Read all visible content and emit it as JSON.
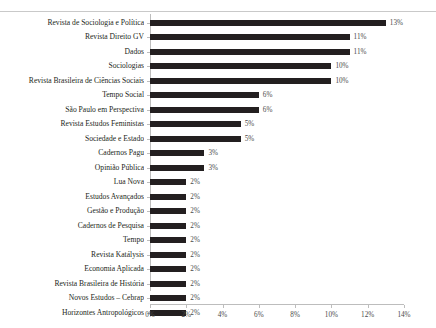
{
  "chart_data": {
    "type": "bar",
    "orientation": "horizontal",
    "title": "",
    "xlabel": "",
    "ylabel": "",
    "xlim": [
      0,
      14
    ],
    "grid": false,
    "legend": null,
    "bar_color": "#231f20",
    "axis_color": "#bdbdbd",
    "value_suffix": "%",
    "xticks": [
      "0%",
      "2%",
      "4%",
      "6%",
      "8%",
      "10%",
      "12%",
      "14%"
    ],
    "xtick_values": [
      0,
      2,
      4,
      6,
      8,
      10,
      12,
      14
    ],
    "categories": [
      "Revista de Sociologia e Política",
      "Revista Direito GV",
      "Dados",
      "Sociologias",
      "Revista Brasileira de Ciências Sociais",
      "Tempo Social",
      "São Paulo em Perspectiva",
      "Revista Estudos Feministas",
      "Sociedade e Estado",
      "Cadernos Pagu",
      "Opinião Pública",
      "Lua Nova",
      "Estudos Avançados",
      "Gestão e Produção",
      "Cadernos de Pesquisa",
      "Tempo",
      "Revista Katálysis",
      "Economia Aplicada",
      "Revista Brasileira de História",
      "Novos Estudos – Cebrap",
      "Horizontes Antropológicos"
    ],
    "values": [
      13,
      11,
      11,
      10,
      10,
      6,
      6,
      5,
      5,
      3,
      3,
      2,
      2,
      2,
      2,
      2,
      2,
      2,
      2,
      2,
      2
    ],
    "data_labels": [
      "13%",
      "11%",
      "11%",
      "10%",
      "10%",
      "6%",
      "6%",
      "5%",
      "5%",
      "3%",
      "3%",
      "2%",
      "2%",
      "2%",
      "2%",
      "2%",
      "2%",
      "2%",
      "2%",
      "2%",
      "2%"
    ]
  }
}
